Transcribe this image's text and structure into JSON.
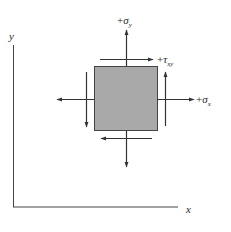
{
  "diagram": {
    "axes": {
      "x_label": "x",
      "y_label": "y"
    },
    "element": {
      "fill_color": "#a9a9a9",
      "stroke_color": "#333333"
    },
    "labels": {
      "sigma_y": {
        "sign": "+",
        "symbol": "σ",
        "subscript": "y"
      },
      "tau_xy": {
        "sign": "+",
        "symbol": "τ",
        "subscript": "xy"
      },
      "sigma_x": {
        "sign": "+",
        "symbol": "σ",
        "subscript": "x"
      }
    },
    "arrows": [
      {
        "name": "sigma-y-up",
        "direction": "up"
      },
      {
        "name": "sigma-y-down",
        "direction": "down"
      },
      {
        "name": "sigma-x-right",
        "direction": "right"
      },
      {
        "name": "sigma-x-left",
        "direction": "left"
      },
      {
        "name": "tau-top",
        "direction": "right"
      },
      {
        "name": "tau-bottom",
        "direction": "left"
      },
      {
        "name": "tau-right",
        "direction": "up"
      },
      {
        "name": "tau-left",
        "direction": "down"
      }
    ],
    "line_color": "#333333"
  }
}
